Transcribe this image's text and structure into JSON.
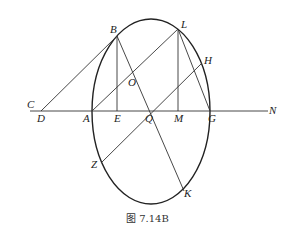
{
  "figure": {
    "caption": "图 7.14B",
    "shape": "ellipse",
    "points": {
      "A": "A",
      "B": "B",
      "C": "C",
      "D": "D",
      "E": "E",
      "G": "G",
      "H": "H",
      "K": "K",
      "L": "L",
      "M": "M",
      "N": "N",
      "O": "O",
      "Q": "Q",
      "Z": "Z"
    },
    "segments": [
      "D-N",
      "D-B",
      "A-L",
      "B-E",
      "L-M",
      "L-G",
      "B-K",
      "Z-H"
    ]
  }
}
